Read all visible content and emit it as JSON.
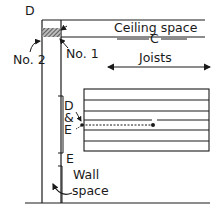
{
  "diagram": {
    "labels": {
      "corner": "D",
      "ceiling_space": "Ceiling space",
      "ceiling_marker": "C",
      "joists": "Joists",
      "no1": "No. 1",
      "no2": "No. 2",
      "d": "D",
      "amp": "&",
      "e": "E",
      "e_bottom": "E",
      "wall": "Wall",
      "space": "space"
    },
    "colors": {
      "line": "#1a1a1a",
      "hatch": "#555555",
      "background": "#ffffff"
    }
  }
}
